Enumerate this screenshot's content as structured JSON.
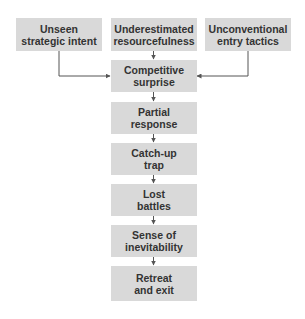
{
  "diagram": {
    "type": "flowchart",
    "colors": {
      "box_fill": "#d9d9d9",
      "text": "#333333",
      "line": "#555555"
    },
    "top_row": [
      {
        "id": "unseen",
        "lines": [
          "Unseen",
          "strategic intent"
        ]
      },
      {
        "id": "underestimated",
        "lines": [
          "Underestimated",
          "resourcefulness"
        ]
      },
      {
        "id": "unconventional",
        "lines": [
          "Unconventional",
          "entry tactics"
        ]
      }
    ],
    "chain": [
      {
        "id": "surprise",
        "lines": [
          "Competitive",
          "surprise"
        ]
      },
      {
        "id": "partial",
        "lines": [
          "Partial",
          "response"
        ]
      },
      {
        "id": "catchup",
        "lines": [
          "Catch-up",
          "trap"
        ]
      },
      {
        "id": "lost",
        "lines": [
          "Lost",
          "battles"
        ]
      },
      {
        "id": "inevitability",
        "lines": [
          "Sense of",
          "inevitability"
        ]
      },
      {
        "id": "retreat",
        "lines": [
          "Retreat",
          "and exit"
        ]
      }
    ],
    "edges": [
      [
        "unseen",
        "surprise"
      ],
      [
        "underestimated",
        "surprise"
      ],
      [
        "unconventional",
        "surprise"
      ],
      [
        "surprise",
        "partial"
      ],
      [
        "partial",
        "catchup"
      ],
      [
        "catchup",
        "lost"
      ],
      [
        "lost",
        "inevitability"
      ],
      [
        "inevitability",
        "retreat"
      ]
    ]
  }
}
